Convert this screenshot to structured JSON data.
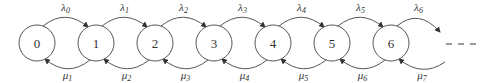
{
  "diagram": {
    "type": "birth-death chain",
    "states": [
      "0",
      "1",
      "2",
      "3",
      "4",
      "5",
      "6"
    ],
    "forward_rates": [
      "λ0",
      "λ1",
      "λ2",
      "λ3",
      "λ4",
      "λ5",
      "λ6"
    ],
    "backward_rates": [
      "μ1",
      "μ2",
      "μ3",
      "μ4",
      "μ5",
      "μ6",
      "μ7"
    ],
    "continuation": "- - -",
    "colors": {
      "stroke": "#555555",
      "text": "#333333",
      "background": "#ffffff"
    }
  }
}
